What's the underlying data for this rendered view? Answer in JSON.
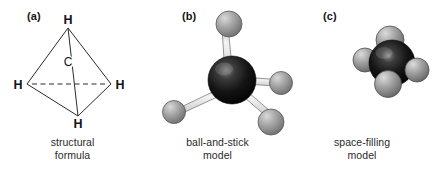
{
  "figure": {
    "background_color": "#ffffff",
    "panels": [
      {
        "letter": "(a)",
        "caption_line1": "structural",
        "caption_line2": "formula",
        "type": "structural-formula",
        "atom_labels": {
          "top": "H",
          "left": "H",
          "right": "H",
          "bottom": "H",
          "center": "C"
        },
        "colors": {
          "line": "#2b2b2b",
          "text": "#141414"
        }
      },
      {
        "letter": "(b)",
        "caption_line1": "ball-and-stick",
        "caption_line2": "model",
        "type": "ball-and-stick-model",
        "colors": {
          "carbon": "#0d0d0d",
          "carbon_highlight": "#6f6f6f",
          "hydrogen": "#a0a0a0",
          "hydrogen_highlight": "#d8d8d8",
          "bond": "#e8e8e8",
          "outline": "#4a4a4a"
        }
      },
      {
        "letter": "(c)",
        "caption_line1": "space-filling",
        "caption_line2": "model",
        "type": "space-filling-model",
        "colors": {
          "carbon": "#0d0d0d",
          "carbon_highlight": "#787878",
          "hydrogen": "#9d9d9d",
          "hydrogen_highlight": "#d4d4d4",
          "outline": "#3c3c3c"
        }
      }
    ]
  }
}
